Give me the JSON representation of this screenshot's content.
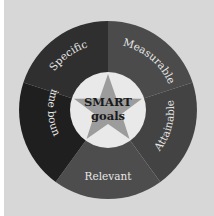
{
  "diagram": {
    "title": "SMART goals",
    "center": {
      "line1": "SMART",
      "line2": "goals"
    },
    "segments": [
      {
        "label": "Specific",
        "color": "#2f2f2f"
      },
      {
        "label": "Measurable",
        "color": "#4b4b4b"
      },
      {
        "label": "Attainable",
        "color": "#434343"
      },
      {
        "label": "Relevant",
        "color": "#4d4d4d"
      },
      {
        "label": "Time bound",
        "color": "#1f1f1f"
      }
    ],
    "colors": {
      "background": "#d7d7d7",
      "inner_circle": "#e9e9e9",
      "star": "#9c9c9c"
    }
  }
}
